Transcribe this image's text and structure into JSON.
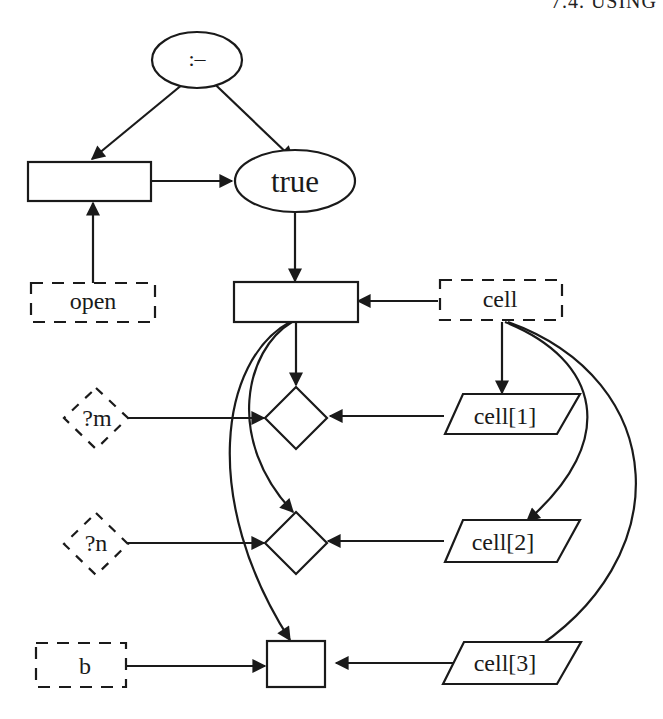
{
  "header": {
    "text": "7.4. USING"
  },
  "diagram": {
    "colors": {
      "stroke": "#1a1a1a",
      "background": "#ffffff"
    },
    "nodes": {
      "neck": {
        "label": ":–",
        "shape": "ellipse"
      },
      "head_box": {
        "label": "",
        "shape": "rectangle"
      },
      "true": {
        "label": "true",
        "shape": "ellipse"
      },
      "open": {
        "label": "open",
        "shape": "dashed-rectangle"
      },
      "body_box": {
        "label": "",
        "shape": "rectangle"
      },
      "cell": {
        "label": "cell",
        "shape": "dashed-rectangle"
      },
      "m": {
        "label": "?m",
        "shape": "dashed-diamond"
      },
      "n": {
        "label": "?n",
        "shape": "dashed-diamond"
      },
      "b": {
        "label": "b",
        "shape": "dashed-rectangle"
      },
      "diamond1": {
        "label": "",
        "shape": "diamond"
      },
      "diamond2": {
        "label": "",
        "shape": "diamond"
      },
      "bottom_box": {
        "label": "",
        "shape": "rectangle"
      },
      "cell1": {
        "label": "cell[1]",
        "shape": "parallelogram"
      },
      "cell2": {
        "label": "cell[2]",
        "shape": "parallelogram"
      },
      "cell3": {
        "label": "cell[3]",
        "shape": "parallelogram"
      }
    },
    "edges": [
      {
        "from": "neck",
        "to": "head_box"
      },
      {
        "from": "neck",
        "to": "true"
      },
      {
        "from": "head_box",
        "to": "true"
      },
      {
        "from": "open",
        "to": "head_box"
      },
      {
        "from": "true",
        "to": "body_box"
      },
      {
        "from": "cell",
        "to": "body_box"
      },
      {
        "from": "body_box",
        "to": "diamond1"
      },
      {
        "from": "body_box",
        "to": "diamond2"
      },
      {
        "from": "body_box",
        "to": "bottom_box"
      },
      {
        "from": "cell",
        "to": "cell1"
      },
      {
        "from": "cell",
        "to": "cell2"
      },
      {
        "from": "cell",
        "to": "cell3"
      },
      {
        "from": "m",
        "to": "diamond1"
      },
      {
        "from": "cell1",
        "to": "diamond1"
      },
      {
        "from": "n",
        "to": "diamond2"
      },
      {
        "from": "cell2",
        "to": "diamond2"
      },
      {
        "from": "b",
        "to": "bottom_box"
      },
      {
        "from": "cell3",
        "to": "bottom_box"
      }
    ]
  }
}
